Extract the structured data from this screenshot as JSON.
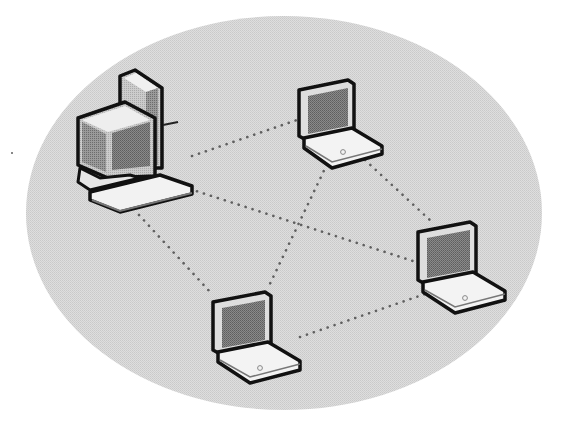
{
  "diagram": {
    "colors": {
      "background": "#ffffff",
      "network_area": "#d9d9d9",
      "outline": "#111111",
      "screen": "#7d7d7d",
      "case_light": "#efefef",
      "case_mid": "#bdbdbd",
      "case_dark": "#6f6f6f",
      "link": "#666666"
    },
    "network_area": {
      "cx": 284,
      "cy": 213,
      "rx": 258,
      "ry": 197
    },
    "nodes": [
      {
        "id": "desktop",
        "type": "desktop-computer",
        "label": ""
      },
      {
        "id": "laptop-top",
        "type": "laptop",
        "label": ""
      },
      {
        "id": "laptop-right",
        "type": "laptop",
        "label": ""
      },
      {
        "id": "laptop-bottom",
        "type": "laptop",
        "label": ""
      }
    ],
    "links": [
      {
        "from": "desktop",
        "to": "laptop-top",
        "x1": 192,
        "y1": 156,
        "x2": 297,
        "y2": 120
      },
      {
        "from": "desktop",
        "to": "laptop-right",
        "x1": 190,
        "y1": 189,
        "x2": 416,
        "y2": 262
      },
      {
        "from": "desktop",
        "to": "laptop-bottom",
        "x1": 139,
        "y1": 215,
        "x2": 212,
        "y2": 294
      },
      {
        "from": "laptop-top",
        "to": "laptop-bottom",
        "x1": 330,
        "y1": 158,
        "x2": 268,
        "y2": 288
      },
      {
        "from": "laptop-top",
        "to": "laptop-right",
        "x1": 365,
        "y1": 160,
        "x2": 432,
        "y2": 222
      },
      {
        "from": "laptop-bottom",
        "to": "laptop-right",
        "x1": 300,
        "y1": 337,
        "x2": 428,
        "y2": 293
      }
    ]
  }
}
